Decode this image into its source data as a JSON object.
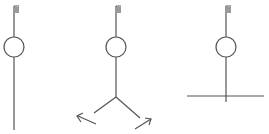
{
  "diagram": {
    "colors": {
      "stroke": "#555555",
      "flag": "#9a9a9a",
      "background": "#ffffff"
    },
    "figures": [
      {
        "id": "straight",
        "variant": "single-line stem",
        "pole_x": 14
      },
      {
        "id": "forked",
        "variant": "stem splitting into two arrows",
        "pole_x": 116
      },
      {
        "id": "crossbar",
        "variant": "stem crossing horizontal line",
        "pole_x": 226
      }
    ]
  }
}
